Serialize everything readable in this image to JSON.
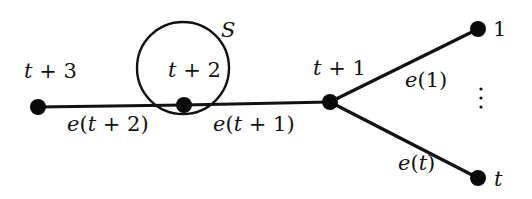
{
  "diagram": {
    "type": "tree",
    "colors": {
      "ink": "#111111",
      "background": "#ffffff"
    },
    "nodes": [
      {
        "id": "t3",
        "label": "t + 3",
        "x": 38,
        "y": 107
      },
      {
        "id": "t2",
        "label": "t + 2",
        "x": 184,
        "y": 105
      },
      {
        "id": "t1",
        "label": "t + 1",
        "x": 330,
        "y": 102
      },
      {
        "id": "n1",
        "label": "1",
        "x": 478,
        "y": 29
      },
      {
        "id": "nt",
        "label": "t",
        "x": 478,
        "y": 178
      }
    ],
    "edges": [
      {
        "from": "t3",
        "to": "t2",
        "label": "e(t + 2)"
      },
      {
        "from": "t2",
        "to": "t1",
        "label": "e(t + 1)"
      },
      {
        "from": "t1",
        "to": "n1",
        "label": "e(1)"
      },
      {
        "from": "t1",
        "to": "nt",
        "label": "e(t)"
      }
    ],
    "set": {
      "label": "S",
      "cx": 183,
      "cy": 68,
      "r": 46
    },
    "ellipsis": "⋮"
  },
  "labels": {
    "node_t3": {
      "var": "t",
      "rest": " + 3"
    },
    "node_t2": {
      "var": "t",
      "rest": " + 2"
    },
    "node_t1": {
      "var": "t",
      "rest": " + 1"
    },
    "node_1": "1",
    "node_t": "t",
    "set_s": "S",
    "edge_t2": {
      "e": "e",
      "open": "(",
      "var": "t",
      "rest": " + 2)"
    },
    "edge_t1": {
      "e": "e",
      "open": "(",
      "var": "t",
      "rest": " + 1)"
    },
    "edge_1": {
      "e": "e",
      "rest": "(1)"
    },
    "edge_t": {
      "e": "e",
      "open": "(",
      "var": "t",
      "close": ")"
    }
  }
}
